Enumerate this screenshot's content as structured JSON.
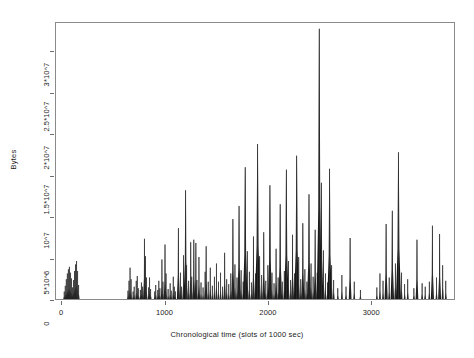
{
  "chart_data": {
    "type": "bar",
    "title": "",
    "subtitle": "",
    "xlabel": "Chronological time (slots of 1000 sec)",
    "ylabel": "Bytes",
    "xlim": [
      -60,
      3810
    ],
    "ylim": [
      0,
      33500000
    ],
    "grid": false,
    "legend": null,
    "xticks": [
      0,
      1000,
      2000,
      3000
    ],
    "xticklabels": [
      "0",
      "1000",
      "2000",
      "3000"
    ],
    "yticks": [
      0,
      5000000,
      10000000,
      15000000,
      20000000,
      25000000,
      30000000
    ],
    "yticklabels": [
      "0",
      "5*10^6",
      "10^7",
      "1.5*10^7",
      "2*10^7",
      "2.5*10^7",
      "3*10^7"
    ],
    "series_name": "Bytes per 1000 sec slot",
    "bar_color": "#161616",
    "frame_color": "#8a8a8a",
    "x": [
      20,
      30,
      40,
      50,
      60,
      70,
      80,
      90,
      100,
      110,
      120,
      130,
      140,
      150,
      160,
      640,
      650,
      660,
      670,
      690,
      700,
      720,
      730,
      740,
      760,
      770,
      780,
      800,
      810,
      820,
      840,
      850,
      860,
      900,
      910,
      930,
      940,
      950,
      970,
      980,
      1000,
      1010,
      1030,
      1050,
      1060,
      1080,
      1090,
      1100,
      1130,
      1150,
      1160,
      1180,
      1200,
      1210,
      1230,
      1250,
      1260,
      1280,
      1300,
      1310,
      1330,
      1350,
      1370,
      1390,
      1400,
      1420,
      1440,
      1460,
      1480,
      1500,
      1520,
      1540,
      1560,
      1580,
      1600,
      1620,
      1640,
      1660,
      1680,
      1700,
      1720,
      1740,
      1760,
      1780,
      1800,
      1820,
      1840,
      1860,
      1880,
      1900,
      1920,
      1940,
      1960,
      1980,
      2000,
      2020,
      2040,
      2060,
      2080,
      2100,
      2120,
      2140,
      2160,
      2180,
      2200,
      2220,
      2240,
      2260,
      2280,
      2300,
      2320,
      2340,
      2360,
      2380,
      2400,
      2420,
      2440,
      2460,
      2480,
      2500,
      2520,
      2540,
      2560,
      2580,
      2600,
      2620,
      2640,
      2680,
      2720,
      2760,
      2800,
      2840,
      2900,
      3060,
      3090,
      3120,
      3150,
      3180,
      3210,
      3240,
      3270,
      3300,
      3330,
      3360,
      3420,
      3450,
      3500,
      3530,
      3570,
      3600,
      3640,
      3670,
      3700,
      3730
    ],
    "values": [
      900000,
      1600000,
      2400000,
      3100000,
      3600000,
      3900000,
      3200000,
      2500000,
      1400000,
      2300000,
      3400000,
      4200000,
      4600000,
      3400000,
      1700000,
      1000000,
      2200000,
      3800000,
      2400000,
      900000,
      1500000,
      2200000,
      2800000,
      1300000,
      1100000,
      2000000,
      1500000,
      7300000,
      5200000,
      2600000,
      1400000,
      2600000,
      1200000,
      900000,
      1700000,
      1100000,
      2200000,
      1300000,
      4800000,
      2100000,
      6600000,
      3100000,
      1200000,
      1900000,
      1000000,
      2700000,
      1500000,
      900000,
      8600000,
      3200000,
      1500000,
      5300000,
      13200000,
      4100000,
      2200000,
      6900000,
      2700000,
      7200000,
      6800000,
      2300000,
      5100000,
      2000000,
      1400000,
      3300000,
      6400000,
      2100000,
      3800000,
      1600000,
      2700000,
      4300000,
      2100000,
      3200000,
      1500000,
      5600000,
      2400000,
      1800000,
      3100000,
      9700000,
      4200000,
      2600000,
      11300000,
      3500000,
      2100000,
      16000000,
      5800000,
      3300000,
      2000000,
      7600000,
      3100000,
      18800000,
      5200000,
      2900000,
      8100000,
      2200000,
      4100000,
      13800000,
      3200000,
      1900000,
      6100000,
      2600000,
      11500000,
      2100000,
      3400000,
      15700000,
      4600000,
      2300000,
      7800000,
      3100000,
      17400000,
      5100000,
      2400000,
      9200000,
      3600000,
      2100000,
      12700000,
      4300000,
      2700000,
      8400000,
      3200000,
      32800000,
      14100000,
      5900000,
      3100000,
      2000000,
      15800000,
      4100000,
      2300000,
      1300000,
      2900000,
      1500000,
      7400000,
      2100000,
      1100000,
      1400000,
      3100000,
      2200000,
      9100000,
      2600000,
      10700000,
      4300000,
      17800000,
      3200000,
      1800000,
      2400000,
      1300000,
      7200000,
      1900000,
      1500000,
      2100000,
      8900000,
      2600000,
      7900000,
      4100000,
      2200000
    ]
  }
}
